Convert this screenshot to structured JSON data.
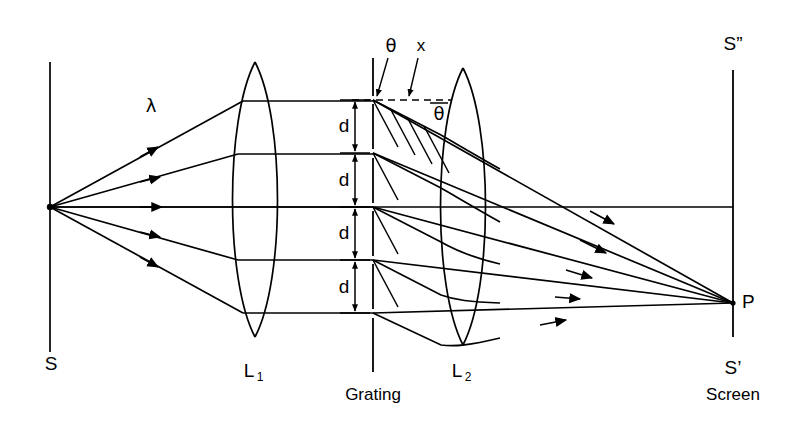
{
  "figure": {
    "type": "optics-ray-diagram",
    "background_color": "#ffffff",
    "ink_color": "#000000",
    "width": 796,
    "height": 429
  },
  "labels": {
    "source_slit": "S",
    "lens1": "L",
    "lens1_sub": "1",
    "lens2": "L",
    "lens2_sub": "2",
    "grating": "Grating",
    "screen": "Screen",
    "screen_top": "S”",
    "screen_bottom": "S’",
    "point_p": "P",
    "wavelength": "λ",
    "theta_incident": "θ",
    "theta_diffracted": "θ",
    "path_difference": "x",
    "spacing_1": "d",
    "spacing_2": "d",
    "spacing_3": "d",
    "spacing_4": "d"
  },
  "geometry": {
    "optical_axis_y": 207,
    "source_line_x": 50,
    "source_line_top": 62,
    "source_line_bottom": 352,
    "source_point": {
      "x": 50,
      "y": 207
    },
    "lens1_center_x": 255,
    "lens1_top_y": 62,
    "lens1_bottom_y": 337,
    "lens2_center_x": 463,
    "lens2_top_y": 68,
    "lens2_bottom_y": 345,
    "grating_line_x": 373,
    "grating_top_y": 58,
    "grating_bottom_y": 372,
    "screen_x": 733,
    "screen_top_y": 70,
    "screen_bottom_y": 337,
    "point_p": {
      "x": 733,
      "y": 303
    },
    "dimension_column_x": 355,
    "slit_positions_y": [
      100,
      153,
      207,
      260,
      313
    ],
    "ray_heights_y": [
      100,
      153,
      207,
      260,
      313
    ],
    "diffraction_angle_deg": 28,
    "dashed_reference_y": 100
  },
  "label_positions": {
    "source_slit": {
      "x": 51,
      "y": 365
    },
    "lens1": {
      "x": 251,
      "y": 372
    },
    "lens2": {
      "x": 459,
      "y": 372
    },
    "grating": {
      "x": 373,
      "y": 396
    },
    "screen": {
      "x": 733,
      "y": 396
    },
    "screen_top": {
      "x": 733,
      "y": 45
    },
    "screen_bottom": {
      "x": 733,
      "y": 369
    },
    "point_p": {
      "x": 743,
      "y": 303
    },
    "wavelength": {
      "x": 151,
      "y": 107
    },
    "theta_incident": {
      "x": 391,
      "y": 47
    },
    "path_difference": {
      "x": 420,
      "y": 47
    },
    "theta_diffracted": {
      "x": 438,
      "y": 113
    },
    "spacing_labels_x": 345,
    "spacing_labels_y": [
      126,
      180,
      233,
      287
    ]
  }
}
